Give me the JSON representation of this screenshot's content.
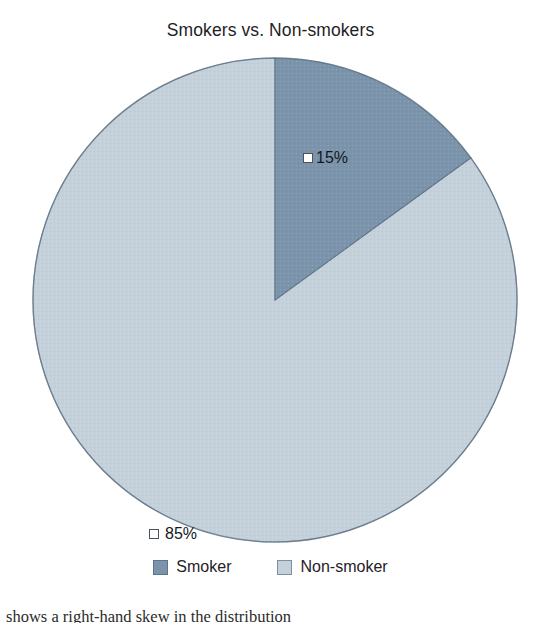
{
  "chart_data": {
    "type": "pie",
    "title": "Smokers vs. Non-smokers",
    "categories": [
      "Smoker",
      "Non-smoker"
    ],
    "values": [
      15,
      85
    ],
    "value_labels": [
      "15%",
      "85%"
    ],
    "colors": [
      "#7b94ac",
      "#c4d1db"
    ],
    "legend_position": "bottom",
    "start_angle_deg": 0,
    "direction": "clockwise",
    "grid": false,
    "xlabel": "",
    "ylabel": ""
  },
  "title": {
    "text": "Smokers vs. Non-smokers"
  },
  "slices": [
    {
      "name": "Smoker",
      "percent": 15,
      "label": "15%",
      "color": "#7b94ac",
      "start_deg": 0,
      "sweep_deg": 54
    },
    {
      "name": "Non-smoker",
      "percent": 85,
      "label": "85%",
      "color": "#c4d1db",
      "start_deg": 54,
      "sweep_deg": 306
    }
  ],
  "legend": {
    "items": [
      {
        "label": "Smoker",
        "color": "#7b94ac"
      },
      {
        "label": "Non-smoker",
        "color": "#c4d1db"
      }
    ]
  },
  "caption": {
    "text": "shows a right-hand skew in the distribution"
  },
  "geometry": {
    "center_x": 243,
    "center_y": 243,
    "radius": 242
  }
}
